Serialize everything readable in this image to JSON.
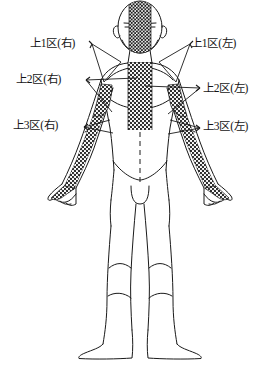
{
  "diagram": {
    "view": "anterior",
    "colors": {
      "outline": "#1a1a1a",
      "stipple": "#262626",
      "background": "#ffffff",
      "leader": "#1a1a1a"
    },
    "labels": {
      "left": [
        {
          "id": "upper-zone-1-right",
          "text": "上1区(右)"
        },
        {
          "id": "upper-zone-2-right",
          "text": "上2区(右)"
        },
        {
          "id": "upper-zone-3-right",
          "text": "上3区(右)"
        }
      ],
      "right": [
        {
          "id": "upper-zone-1-left",
          "text": "上1区(左)"
        },
        {
          "id": "upper-zone-2-left",
          "text": "上2区(左)"
        },
        {
          "id": "upper-zone-3-left",
          "text": "上3区(左)"
        }
      ]
    },
    "regions": [
      {
        "name": "head-midline-band",
        "shading": "stippled"
      },
      {
        "name": "torso-midline-band",
        "shading": "stippled"
      },
      {
        "name": "left-arm-band",
        "shading": "stippled"
      },
      {
        "name": "right-arm-band",
        "shading": "stippled"
      },
      {
        "name": "abdomen-midline",
        "shading": "dashed-line"
      },
      {
        "name": "legs",
        "shading": "outline-only"
      }
    ]
  }
}
